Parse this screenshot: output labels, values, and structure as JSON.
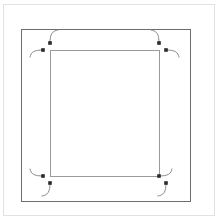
{
  "figure": {
    "type": "technical-line-diagram",
    "width": 217,
    "height": 219,
    "background_color": "#ffffff"
  },
  "colors": {
    "outer_frame_stroke": "#e2e2e2",
    "inner_frame_stroke": "#6e6e6e",
    "path_stroke": "#9a9a9a",
    "arc_stroke": "#8a8a8a",
    "node_fill": "#2a2a2a",
    "background": "#ffffff"
  },
  "outer_frame": {
    "name": "outer-frame",
    "x": 3,
    "y": 4,
    "width": 211,
    "height": 211,
    "stroke_width": 1
  },
  "inner_frame": {
    "name": "inner-frame",
    "x": 21,
    "y": 29,
    "width": 169,
    "height": 172,
    "stroke_width": 1
  },
  "toolpath_rect": {
    "name": "toolpath-rectangle",
    "x": 50,
    "y": 50,
    "width": 109,
    "height": 126,
    "stroke_width": 1
  },
  "nodes": [
    {
      "id": "tl-upper",
      "label": "top-left-upper-node",
      "x": 50,
      "y": 43
    },
    {
      "id": "tl-lower",
      "label": "top-left-lower-node",
      "x": 43,
      "y": 50
    },
    {
      "id": "tr-upper",
      "label": "top-right-upper-node",
      "x": 159,
      "y": 43
    },
    {
      "id": "tr-lower",
      "label": "top-right-lower-node",
      "x": 166,
      "y": 50
    },
    {
      "id": "bl-upper",
      "label": "bottom-left-upper-node",
      "x": 43,
      "y": 176
    },
    {
      "id": "bl-lower",
      "label": "bottom-left-lower-node",
      "x": 50,
      "y": 183
    },
    {
      "id": "br-upper",
      "label": "bottom-right-upper-node",
      "x": 159,
      "y": 176
    },
    {
      "id": "br-lower",
      "label": "bottom-right-lower-node",
      "x": 166,
      "y": 183
    }
  ],
  "arcs": [
    {
      "id": "tl-arc-vertical",
      "label": "top-left-vertical-lead-arc",
      "d": "M 50 43 C 50 34 52 31 58 30"
    },
    {
      "id": "tl-arc-horizontal",
      "label": "top-left-horizontal-lead-arc",
      "d": "M 43 50 C 34 50 31 52 30 57"
    },
    {
      "id": "tr-arc-vertical",
      "label": "top-right-vertical-lead-arc",
      "d": "M 159 43 C 159 34 157 31 151 30"
    },
    {
      "id": "tr-arc-horizontal",
      "label": "top-right-horizontal-lead-arc",
      "d": "M 166 50 C 175 50 178 52 179 57"
    },
    {
      "id": "bl-arc-horizontal",
      "label": "bottom-left-horizontal-lead-arc",
      "d": "M 43 176 C 34 176 31 174 30 169"
    },
    {
      "id": "bl-arc-vertical",
      "label": "bottom-left-vertical-lead-arc",
      "d": "M 50 183 C 50 192 48 195 42 196"
    },
    {
      "id": "br-arc-horizontal",
      "label": "bottom-right-horizontal-lead-arc",
      "d": "M 159 176 C 168 176 171 174 172 169"
    },
    {
      "id": "br-arc-vertical",
      "label": "bottom-right-vertical-lead-arc",
      "d": "M 166 183 C 166 192 164 195 158 196"
    }
  ],
  "node_size": 3.6
}
